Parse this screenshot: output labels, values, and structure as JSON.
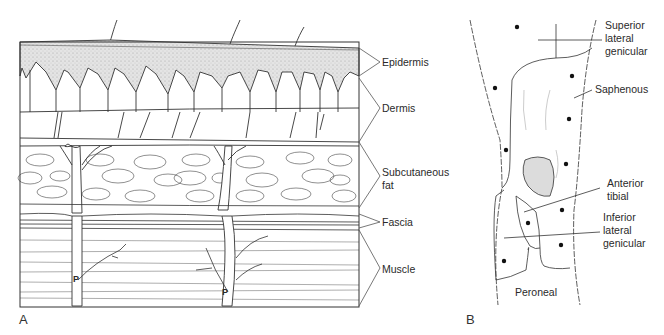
{
  "panel_a": {
    "letter": "A",
    "layers": [
      {
        "label_line1": "Epidermis",
        "label_line2": ""
      },
      {
        "label_line1": "Dermis",
        "label_line2": ""
      },
      {
        "label_line1": "Subcutaneous",
        "label_line2": "fat"
      },
      {
        "label_line1": "Fascia",
        "label_line2": ""
      },
      {
        "label_line1": "Muscle",
        "label_line2": ""
      }
    ],
    "perforator_marks": [
      "P",
      "P"
    ]
  },
  "panel_b": {
    "letter": "B",
    "nerves": [
      {
        "line1": "Superior",
        "line2": "lateral",
        "line3": "genicular"
      },
      {
        "line1": "Saphenous",
        "line2": "",
        "line3": ""
      },
      {
        "line1": "Anterior",
        "line2": "tibial",
        "line3": ""
      },
      {
        "line1": "Inferior",
        "line2": "lateral",
        "line3": "genicular"
      },
      {
        "line1": "Peroneal",
        "line2": "",
        "line3": ""
      }
    ]
  }
}
